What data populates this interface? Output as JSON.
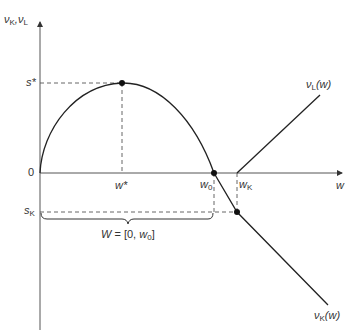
{
  "diagram": {
    "y_axis_label": {
      "nu": "ν",
      "k": "K",
      "sep": ",",
      "nu2": "ν",
      "l": "L"
    },
    "x_axis_label": "w",
    "origin_label": "0",
    "s_star_label": "s*",
    "s_k_label": {
      "s": "s",
      "k": "K"
    },
    "w_star_label": "w*",
    "w0_label": {
      "w": "w",
      "sub": "0"
    },
    "wk_label": {
      "w": "w",
      "sub": "K"
    },
    "nu_l_label": {
      "nu": "ν",
      "sub": "L",
      "arg": "(w)"
    },
    "nu_k_label": {
      "nu": "ν",
      "sub": "K",
      "arg": "(w)"
    },
    "set_label": {
      "W": "W",
      "eq": " = [0, ",
      "w": "w",
      "sub": "0",
      "close": "]"
    },
    "line_color": "#222222",
    "dash_color": "#555555"
  }
}
